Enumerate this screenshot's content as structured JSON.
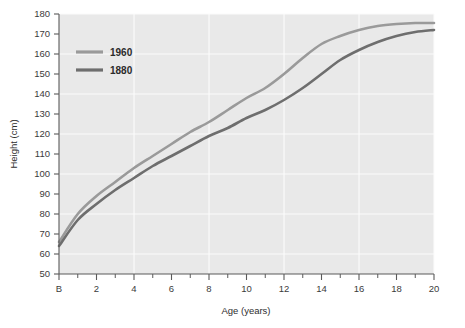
{
  "chart_data": {
    "type": "line",
    "title": "",
    "xlabel": "Age (years)",
    "ylabel": "Height (cm)",
    "xlim": [
      0,
      20
    ],
    "ylim": [
      50,
      180
    ],
    "x_tick_labels": [
      "B",
      "2",
      "4",
      "6",
      "8",
      "10",
      "12",
      "14",
      "16",
      "18",
      "20"
    ],
    "x_tick_values": [
      0,
      2,
      4,
      6,
      8,
      10,
      12,
      14,
      16,
      18,
      20
    ],
    "x_minor_tick_values": [
      1,
      3,
      5,
      7,
      9,
      11,
      13,
      15,
      17,
      19
    ],
    "y_tick_labels": [
      "50",
      "60",
      "70",
      "80",
      "90",
      "100",
      "110",
      "120",
      "130",
      "140",
      "150",
      "160",
      "170",
      "180"
    ],
    "y_tick_values": [
      50,
      60,
      70,
      80,
      90,
      100,
      110,
      120,
      130,
      140,
      150,
      160,
      170,
      180
    ],
    "grid": true,
    "grid_x_values": [
      4,
      8,
      12,
      16,
      20
    ],
    "grid_y_values": [
      60,
      80,
      100,
      120,
      140,
      160,
      180
    ],
    "legend_position": "top-left",
    "x": [
      0,
      1,
      2,
      3,
      4,
      5,
      6,
      7,
      8,
      9,
      10,
      11,
      12,
      13,
      14,
      15,
      16,
      17,
      18,
      19,
      20
    ],
    "series": [
      {
        "name": "1960",
        "color": "#9a9a9a",
        "values": [
          66,
          80,
          89,
          96,
          103,
          109,
          115,
          121,
          126,
          132,
          138,
          143,
          150,
          158,
          165,
          169,
          172,
          174,
          175,
          175.5,
          175.5
        ]
      },
      {
        "name": "1880",
        "color": "#6e6e6e",
        "values": [
          64,
          77,
          85,
          92,
          98,
          104,
          109,
          114,
          119,
          123,
          128,
          132,
          137,
          143,
          150,
          157,
          162,
          166,
          169,
          171,
          172
        ]
      }
    ],
    "colors": {
      "plot_background": "#e9e9e9",
      "page_background": "#ffffff",
      "gridline": "#fbfbfb",
      "axis": "#5a5a5a",
      "text": "#333333",
      "series_1960": "#9a9a9a",
      "series_1880": "#6e6e6e"
    },
    "legend": [
      {
        "label": "1960",
        "color": "#9a9a9a"
      },
      {
        "label": "1880",
        "color": "#6e6e6e"
      }
    ]
  }
}
